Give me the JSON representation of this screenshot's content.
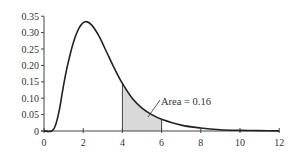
{
  "chart_data": {
    "type": "area",
    "title": "",
    "xlabel": "",
    "ylabel": "",
    "xlim": [
      0,
      12
    ],
    "ylim": [
      0,
      0.35
    ],
    "grid": false,
    "legend": null,
    "x_ticks": [
      0,
      2,
      4,
      6,
      8,
      10,
      12
    ],
    "x_tick_labels": [
      "0",
      "2",
      "4",
      "6",
      "8",
      "10",
      "12"
    ],
    "y_ticks": [
      0,
      0.05,
      0.1,
      0.15,
      0.2,
      0.25,
      0.3,
      0.35
    ],
    "y_tick_labels": [
      "0",
      "0.05",
      "0.10",
      "0.15",
      "0.20",
      "0.25",
      "0.30",
      "0.35"
    ],
    "series": [
      {
        "name": "density curve",
        "x": [
          0,
          0.4,
          0.6,
          0.8,
          1.0,
          1.2,
          1.5,
          1.8,
          2.1,
          2.4,
          2.8,
          3.2,
          3.6,
          4.0,
          4.5,
          5.0,
          5.5,
          6.0,
          7.0,
          8.0,
          9.0,
          10.0,
          11.0,
          12.0
        ],
        "y": [
          0,
          0.0,
          0.02,
          0.07,
          0.14,
          0.2,
          0.27,
          0.315,
          0.333,
          0.325,
          0.29,
          0.24,
          0.19,
          0.145,
          0.1,
          0.07,
          0.05,
          0.036,
          0.018,
          0.009,
          0.004,
          0.002,
          0.001,
          0.0005
        ]
      }
    ],
    "shaded_region": {
      "x_from": 4,
      "x_to": 6,
      "color": "#d9d9d9"
    },
    "annotations": [
      {
        "text": "Area = 0.16",
        "x": 6.0,
        "y": 0.085
      }
    ]
  },
  "labels": {
    "area_annotation": "Area = 0.16"
  }
}
